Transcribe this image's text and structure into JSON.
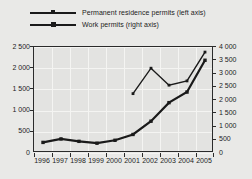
{
  "legend": {
    "position": "top-left",
    "items": [
      {
        "label": "Permanent residence permits (left axis)",
        "marker": "square",
        "style": "thin",
        "color": "#1a1a1a"
      },
      {
        "label": "Work permits (right axis)",
        "marker": "square",
        "style": "thick",
        "color": "#1a1a1a"
      }
    ]
  },
  "axes": {
    "left_ticks": [
      "0",
      "500",
      "1 000",
      "1 500",
      "2 000",
      "2 500"
    ],
    "right_ticks": [
      "0",
      "500",
      "1 000",
      "1 500",
      "2 000",
      "2 500",
      "3 000",
      "3 500",
      "4 000"
    ],
    "x_ticks": [
      "1996",
      "1997",
      "1998",
      "1999",
      "2000",
      "2001",
      "2002",
      "2003",
      "2004",
      "2005"
    ]
  },
  "chart_data": {
    "type": "line",
    "title": "",
    "xlabel": "",
    "ylabel": "",
    "grid": true,
    "legend_position": "top-left",
    "categories": [
      "1996",
      "1997",
      "1998",
      "1999",
      "2000",
      "2001",
      "2002",
      "2003",
      "2004",
      "2005"
    ],
    "series": [
      {
        "name": "Permanent residence permits (left axis)",
        "axis": "left",
        "ylabel": "Permanent residence permits",
        "ylim": [
          0,
          2500
        ],
        "yticks": [
          0,
          500,
          1000,
          1500,
          2000,
          2500
        ],
        "x": [
          "2001",
          "2002",
          "2003",
          "2004",
          "2005"
        ],
        "values": [
          1400,
          2000,
          1600,
          1700,
          2380
        ],
        "color": "#1a1a1a",
        "linewidth": 1.4,
        "marker": "square"
      },
      {
        "name": "Work permits (right axis)",
        "axis": "right",
        "ylabel": "Work permits",
        "ylim": [
          0,
          4000
        ],
        "yticks": [
          0,
          500,
          1000,
          1500,
          2000,
          2500,
          3000,
          3500,
          4000
        ],
        "x": [
          "1996",
          "1997",
          "1998",
          "1999",
          "2000",
          "2001",
          "2002",
          "2003",
          "2004",
          "2005"
        ],
        "values": [
          400,
          530,
          440,
          370,
          480,
          700,
          1200,
          1900,
          2300,
          3500
        ],
        "color": "#1a1a1a",
        "linewidth": 2.2,
        "marker": "square"
      }
    ]
  }
}
